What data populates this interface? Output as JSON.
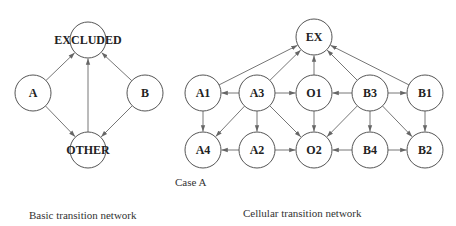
{
  "diagrams": [
    {
      "id": "basic",
      "caption": "Basic transition network",
      "nodes": [
        {
          "id": "EXCLUDED",
          "label": "EXCLUDED",
          "x": 88,
          "y": 40
        },
        {
          "id": "A",
          "label": "A",
          "x": 33,
          "y": 93
        },
        {
          "id": "B",
          "label": "B",
          "x": 145,
          "y": 93
        },
        {
          "id": "OTHER",
          "label": "OTHER",
          "x": 88,
          "y": 150
        }
      ],
      "edges": [
        [
          "A",
          "EXCLUDED"
        ],
        [
          "A",
          "OTHER"
        ],
        [
          "B",
          "EXCLUDED"
        ],
        [
          "B",
          "OTHER"
        ],
        [
          "OTHER",
          "EXCLUDED"
        ]
      ]
    },
    {
      "id": "cellular",
      "caption": "Cellular transition network",
      "subcaption": "Case A",
      "nodes": [
        {
          "id": "EX",
          "label": "EX",
          "x": 314,
          "y": 37
        },
        {
          "id": "A1",
          "label": "A1",
          "x": 203,
          "y": 93
        },
        {
          "id": "A3",
          "label": "A3",
          "x": 257,
          "y": 93
        },
        {
          "id": "O1",
          "label": "O1",
          "x": 314,
          "y": 93
        },
        {
          "id": "B3",
          "label": "B3",
          "x": 370,
          "y": 93
        },
        {
          "id": "B1",
          "label": "B1",
          "x": 425,
          "y": 93
        },
        {
          "id": "A4",
          "label": "A4",
          "x": 203,
          "y": 150
        },
        {
          "id": "A2",
          "label": "A2",
          "x": 257,
          "y": 150
        },
        {
          "id": "O2",
          "label": "O2",
          "x": 314,
          "y": 150
        },
        {
          "id": "B4",
          "label": "B4",
          "x": 370,
          "y": 150
        },
        {
          "id": "B2",
          "label": "B2",
          "x": 425,
          "y": 150
        }
      ],
      "edges": [
        [
          "A1",
          "EX"
        ],
        [
          "A3",
          "EX"
        ],
        [
          "O1",
          "EX"
        ],
        [
          "B3",
          "EX"
        ],
        [
          "B1",
          "EX"
        ],
        [
          "A3",
          "A1"
        ],
        [
          "A3",
          "O1"
        ],
        [
          "B3",
          "O1"
        ],
        [
          "B3",
          "B1"
        ],
        [
          "A1",
          "A4"
        ],
        [
          "A3",
          "A4"
        ],
        [
          "A3",
          "A2"
        ],
        [
          "A3",
          "O2"
        ],
        [
          "O1",
          "O2"
        ],
        [
          "B3",
          "O2"
        ],
        [
          "B3",
          "B4"
        ],
        [
          "B3",
          "B2"
        ],
        [
          "B1",
          "B2"
        ],
        [
          "A2",
          "A4"
        ],
        [
          "A2",
          "O2"
        ],
        [
          "B4",
          "O2"
        ],
        [
          "B4",
          "B2"
        ]
      ]
    }
  ],
  "node_radius": 18,
  "colors": {
    "stroke": "#555555",
    "edge": "#666666",
    "text": "#222222",
    "background": "#ffffff"
  }
}
